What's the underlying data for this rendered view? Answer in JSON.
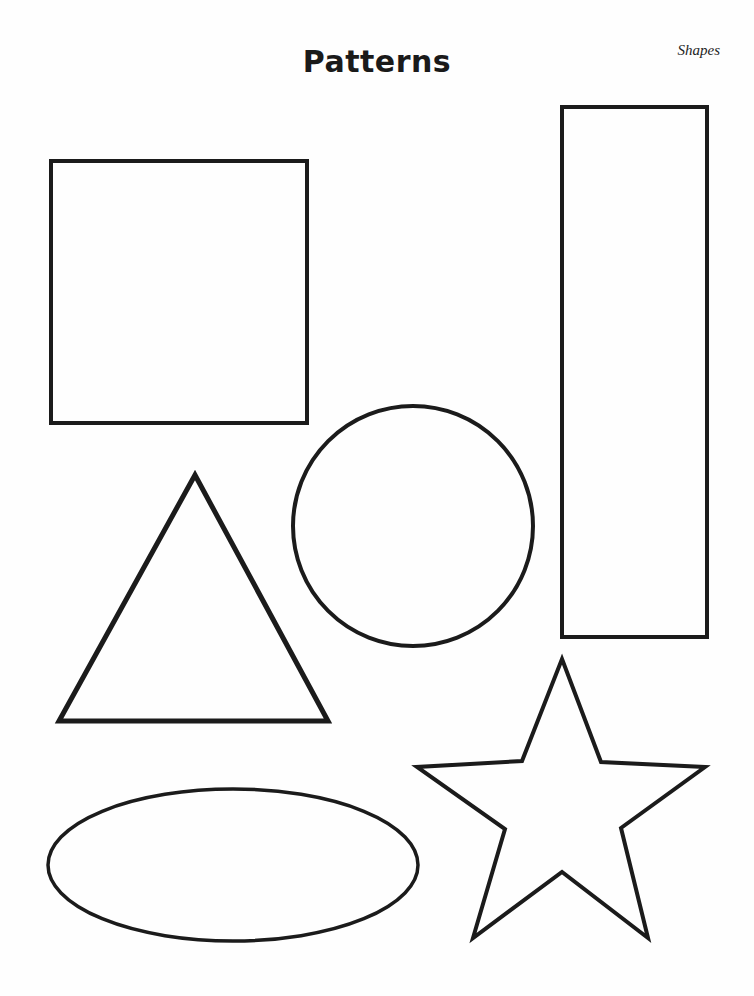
{
  "page": {
    "title": "Patterns",
    "corner_label": "Shapes",
    "background_color": "#fefefe",
    "ink_color": "#1b1b1b",
    "width": 754,
    "height": 996
  },
  "shapes": [
    {
      "name": "square",
      "label": "Square",
      "type": "rect",
      "x": 51,
      "y": 161,
      "width": 256,
      "height": 262,
      "stroke_width": 4
    },
    {
      "name": "tall-rectangle",
      "label": "Rectangle",
      "type": "rect",
      "x": 562,
      "y": 107,
      "width": 145,
      "height": 530,
      "stroke_width": 4
    },
    {
      "name": "circle",
      "label": "Circle",
      "type": "circle",
      "cx": 413,
      "cy": 526,
      "r": 120,
      "stroke_width": 4
    },
    {
      "name": "triangle",
      "label": "Triangle",
      "type": "polygon",
      "points": "195,475 328,721 59,721",
      "stroke_width": 5
    },
    {
      "name": "ellipse",
      "label": "Ellipse",
      "type": "ellipse",
      "cx": 233,
      "cy": 865,
      "rx": 185,
      "ry": 76,
      "stroke_width": 3.5
    },
    {
      "name": "star",
      "label": "Star",
      "type": "polygon",
      "points": "562,659 601,762 705,767 621,828 648,938 562,872 473,938 505,829 417,767 522,761",
      "stroke_width": 4
    }
  ]
}
